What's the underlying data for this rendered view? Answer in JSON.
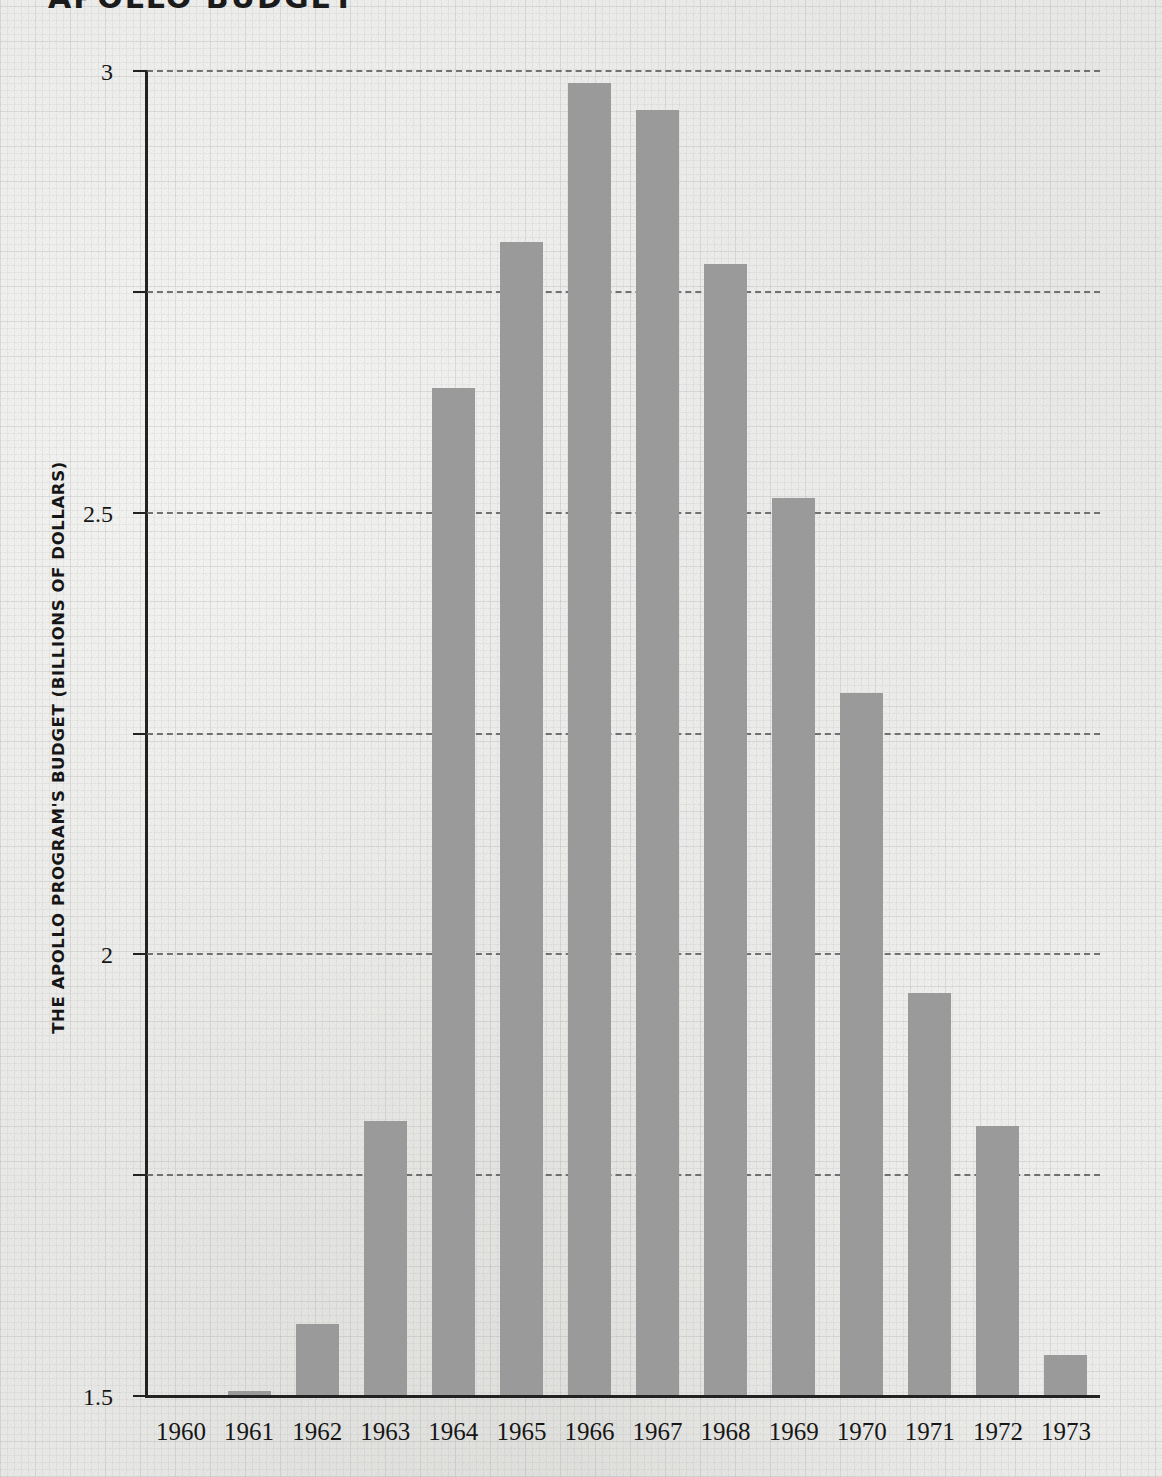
{
  "title": "APOLLO BUDGET",
  "colors": {
    "bar": "#9a9a9a",
    "axis": "#222222",
    "grid": "#5d5d5d",
    "paper": "#e9e9e7",
    "text": "#161616"
  },
  "chart_data": {
    "type": "bar",
    "title": "APOLLO BUDGET",
    "xlabel": "",
    "ylabel": "THE APOLLO PROGRAM'S BUDGET (BILLIONS OF DOLLARS)",
    "categories": [
      "1960",
      "1961",
      "1962",
      "1963",
      "1964",
      "1965",
      "1966",
      "1967",
      "1968",
      "1969",
      "1970",
      "1971",
      "1972",
      "1973"
    ],
    "values": [
      0.0,
      0.01,
      0.16,
      0.62,
      2.28,
      2.61,
      2.97,
      2.91,
      2.56,
      2.03,
      1.59,
      0.91,
      0.61,
      0.09
    ],
    "ylim": [
      0,
      3
    ],
    "yticks": [
      0,
      0.5,
      1,
      1.5,
      2,
      2.5,
      3
    ],
    "ytick_labels": [
      "0",
      "0.5",
      "1",
      "1.5",
      "2",
      "2.5",
      "3"
    ],
    "xtick_labels": [
      "1960",
      "1961",
      "1962",
      "1963",
      "1964",
      "1965",
      "1966",
      "1967",
      "1968",
      "1969",
      "1970",
      "1971",
      "1972",
      "1973"
    ],
    "grid": "horizontal-dashed",
    "legend": null,
    "units": "billions of dollars"
  }
}
